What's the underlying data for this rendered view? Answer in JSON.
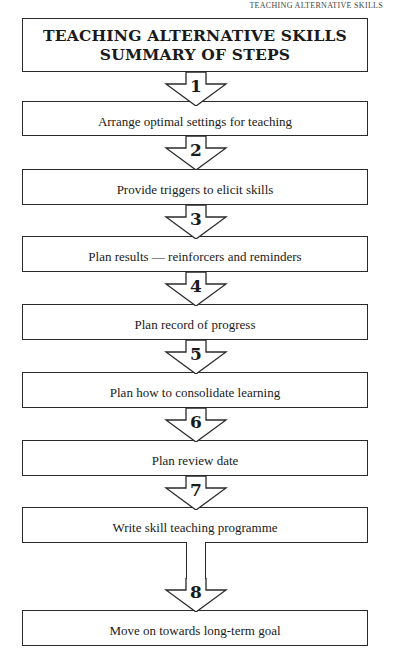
{
  "running_head": "TEACHING ALTERNATIVE SKILLS",
  "title": {
    "line1": "TEACHING ALTERNATIVE SKILLS",
    "line2": "SUMMARY OF STEPS"
  },
  "steps": [
    {
      "number": "1",
      "label": "Arrange optimal settings for teaching"
    },
    {
      "number": "2",
      "label": "Provide triggers to elicit skills"
    },
    {
      "number": "3",
      "label": "Plan results — reinforcers and reminders"
    },
    {
      "number": "4",
      "label": "Plan record of progress"
    },
    {
      "number": "5",
      "label": "Plan how to consolidate learning"
    },
    {
      "number": "6",
      "label": "Plan review date"
    },
    {
      "number": "7",
      "label": "Write skill teaching programme"
    },
    {
      "number": "8",
      "label": "Move on towards long-term goal"
    }
  ],
  "colors": {
    "line": "#2a2a2a",
    "background": "#ffffff",
    "text": "#1a1a1a"
  }
}
